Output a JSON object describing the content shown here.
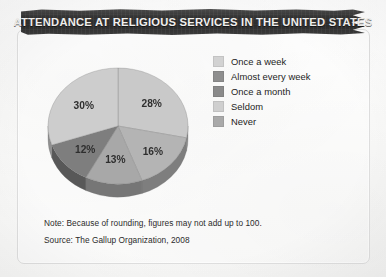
{
  "banner": {
    "title": "ATTENDANCE AT RELIGIOUS SERVICES IN THE UNITED STATES"
  },
  "notes": {
    "note": "Note: Because of rounding, figures may not add up to 100.",
    "source": "Source: The Gallup Organization, 2008"
  },
  "labels": {
    "slice_0": "28%",
    "slice_1": "16%",
    "slice_2": "13%",
    "slice_3": "12%",
    "slice_4": "30%"
  },
  "legend": {
    "items": [
      {
        "label": "Once a week",
        "swatch": "#d2d2d2"
      },
      {
        "label": "Almost every week",
        "swatch": "#8e8e8e"
      },
      {
        "label": "Once a month",
        "swatch": "#8a8a8a"
      },
      {
        "label": "Seldom",
        "swatch": "#cfcfcf"
      },
      {
        "label": "Never",
        "swatch": "#a9a9a9"
      }
    ]
  },
  "chart_data": {
    "type": "pie",
    "title": "ATTENDANCE AT RELIGIOUS SERVICES IN THE UNITED STATES",
    "categories": [
      "Once a week",
      "Almost every week",
      "Once a month",
      "Seldom",
      "Never"
    ],
    "values": [
      28,
      16,
      13,
      12,
      30
    ],
    "value_labels": [
      "28%",
      "16%",
      "13%",
      "12%",
      "30%"
    ],
    "unit": "percent",
    "total": 99,
    "legend_position": "right",
    "three_d": true,
    "start_angle_deg": 0,
    "direction": "clockwise",
    "slice_colors": [
      "#c9c9c9",
      "#b4b4b4",
      "#a8a8a8",
      "#7e7e7e",
      "#cdcdcd"
    ],
    "note": "Note: Because of rounding, figures may not add up to 100.",
    "source": "Source: The Gallup Organization, 2008"
  }
}
